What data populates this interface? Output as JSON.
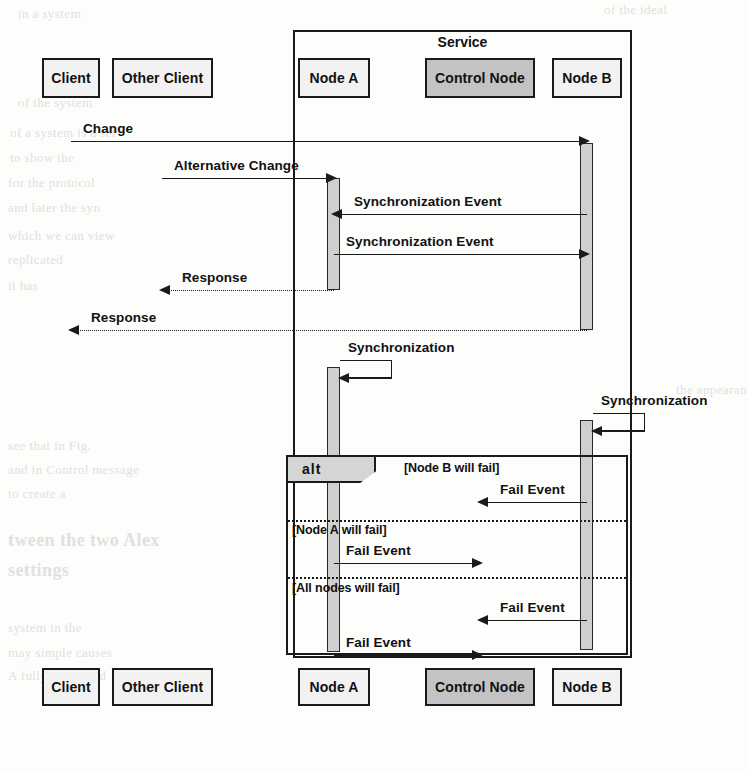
{
  "diagram": {
    "type": "uml-sequence-diagram",
    "service_frame_label": "Service",
    "fragment_operator": "alt"
  },
  "participants": [
    {
      "id": "client",
      "label": "Client",
      "shaded": false,
      "x": 71,
      "box": {
        "left": 42,
        "top": 58,
        "width": 58,
        "height": 40
      }
    },
    {
      "id": "other_client",
      "label": "Other Client",
      "shaded": false,
      "x": 162,
      "box": {
        "left": 112,
        "top": 58,
        "width": 101,
        "height": 40
      }
    },
    {
      "id": "node_a",
      "label": "Node A",
      "shaded": false,
      "x": 334,
      "box": {
        "left": 298,
        "top": 58,
        "width": 72,
        "height": 40
      }
    },
    {
      "id": "control_node",
      "label": "Control Node",
      "shaded": true,
      "x": 480,
      "box": {
        "left": 425,
        "top": 58,
        "width": 110,
        "height": 40
      }
    },
    {
      "id": "node_b",
      "label": "Node B",
      "shaded": false,
      "x": 587,
      "box": {
        "left": 552,
        "top": 58,
        "width": 70,
        "height": 40
      }
    }
  ],
  "participants_bottom": [
    {
      "id": "client",
      "label": "Client",
      "shaded": false,
      "box": {
        "left": 42,
        "top": 668,
        "width": 58,
        "height": 38
      }
    },
    {
      "id": "other_client",
      "label": "Other Client",
      "shaded": false,
      "box": {
        "left": 112,
        "top": 668,
        "width": 101,
        "height": 38
      }
    },
    {
      "id": "node_a",
      "label": "Node A",
      "shaded": false,
      "box": {
        "left": 298,
        "top": 668,
        "width": 72,
        "height": 38
      }
    },
    {
      "id": "control_node",
      "label": "Control Node",
      "shaded": true,
      "box": {
        "left": 425,
        "top": 668,
        "width": 110,
        "height": 38
      }
    },
    {
      "id": "node_b",
      "label": "Node B",
      "shaded": false,
      "box": {
        "left": 552,
        "top": 668,
        "width": 70,
        "height": 38
      }
    }
  ],
  "messages": [
    {
      "id": "m1",
      "label": "Change",
      "from": "client",
      "to": "node_b",
      "y": 141,
      "style": "solid",
      "direction": "right"
    },
    {
      "id": "m2",
      "label": "Alternative Change",
      "from": "other_client",
      "to": "node_a",
      "y": 178,
      "style": "solid",
      "direction": "right"
    },
    {
      "id": "m3",
      "label": "Synchronization Event",
      "from": "node_b",
      "to": "node_a",
      "y": 214,
      "style": "solid",
      "direction": "left"
    },
    {
      "id": "m4",
      "label": "Synchronization Event",
      "from": "node_a",
      "to": "node_b",
      "y": 254,
      "style": "solid",
      "direction": "right"
    },
    {
      "id": "m5",
      "label": "Response",
      "from": "node_a",
      "to": "other_client",
      "y": 290,
      "style": "dotted",
      "direction": "left"
    },
    {
      "id": "m6",
      "label": "Response",
      "from": "node_b",
      "to": "client",
      "y": 330,
      "style": "dotted",
      "direction": "left"
    },
    {
      "id": "m7",
      "label": "Synchronization",
      "from": "node_a",
      "to": "node_a",
      "y": 378,
      "style": "solid",
      "direction": "self"
    },
    {
      "id": "m8",
      "label": "Synchronization",
      "from": "node_b",
      "to": "node_b",
      "y": 431,
      "style": "solid",
      "direction": "self"
    },
    {
      "id": "m9",
      "label": "Fail Event",
      "from": "node_b",
      "to": "control_node",
      "y": 502,
      "style": "solid",
      "direction": "left"
    },
    {
      "id": "m10",
      "label": "Fail Event",
      "from": "node_a",
      "to": "control_node",
      "y": 563,
      "style": "solid",
      "direction": "right"
    },
    {
      "id": "m11",
      "label": "Fail Event",
      "from": "node_b",
      "to": "control_node",
      "y": 620,
      "style": "solid",
      "direction": "left"
    },
    {
      "id": "m12",
      "label": "Fail Event",
      "from": "node_a",
      "to": "control_node",
      "y": 655,
      "style": "solid",
      "direction": "right"
    }
  ],
  "activations": [
    {
      "id": "a1",
      "participant": "node_b",
      "top": 143,
      "height": 187
    },
    {
      "id": "a2",
      "participant": "node_a",
      "top": 178,
      "height": 112
    },
    {
      "id": "a3",
      "participant": "node_a",
      "top": 367,
      "height": 285
    },
    {
      "id": "a4",
      "participant": "node_b",
      "top": 420,
      "height": 230
    }
  ],
  "fragment": {
    "operator": "alt",
    "box": {
      "left": 286,
      "top": 455,
      "width": 342,
      "height": 200
    },
    "tag": {
      "width": 88,
      "height": 26
    },
    "operands": [
      {
        "guard": "[Node B will fail]",
        "guard_x": 404,
        "guard_y": 461,
        "divider_y": null
      },
      {
        "guard": "[Node A will fail]",
        "guard_x": 292,
        "guard_y": 523,
        "divider_y": 520
      },
      {
        "guard": "[All nodes will fail]",
        "guard_x": 292,
        "guard_y": 581,
        "divider_y": 577
      }
    ]
  },
  "service_frame": {
    "label": "Service",
    "box": {
      "left": 293,
      "top": 30,
      "width": 339,
      "height": 628
    },
    "title_y": 34
  },
  "bleed_text": [
    {
      "text": "in a system",
      "x": 18,
      "y": 6,
      "size": 13
    },
    {
      "text": "of the ideal",
      "x": 604,
      "y": 2,
      "size": 13
    },
    {
      "text": "of the system",
      "x": 18,
      "y": 95,
      "size": 13
    },
    {
      "text": "of a system is a set",
      "x": 10,
      "y": 125,
      "size": 13
    },
    {
      "text": "to show the",
      "x": 10,
      "y": 150,
      "size": 13
    },
    {
      "text": "for the protocol",
      "x": 8,
      "y": 175,
      "size": 13
    },
    {
      "text": "and later the syn",
      "x": 8,
      "y": 200,
      "size": 13
    },
    {
      "text": "which we can view",
      "x": 8,
      "y": 228,
      "size": 13
    },
    {
      "text": "replicated",
      "x": 8,
      "y": 252,
      "size": 13
    },
    {
      "text": "it has",
      "x": 8,
      "y": 278,
      "size": 13
    },
    {
      "text": "the appearan",
      "x": 676,
      "y": 382,
      "size": 13
    },
    {
      "text": "see that in Fig.",
      "x": 8,
      "y": 438,
      "size": 13
    },
    {
      "text": "and in Control message",
      "x": 8,
      "y": 462,
      "size": 13
    },
    {
      "text": "to create a",
      "x": 8,
      "y": 486,
      "size": 13
    },
    {
      "text": "tween the two Alex",
      "x": 8,
      "y": 530,
      "size": 18
    },
    {
      "text": "settings",
      "x": 8,
      "y": 560,
      "size": 18
    },
    {
      "text": "system in the",
      "x": 8,
      "y": 620,
      "size": 13
    },
    {
      "text": "may simple causes",
      "x": 8,
      "y": 645,
      "size": 13
    },
    {
      "text": "A fully replicated",
      "x": 8,
      "y": 668,
      "size": 13
    }
  ]
}
